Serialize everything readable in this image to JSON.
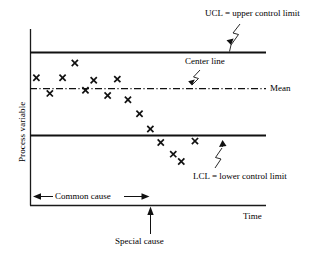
{
  "figure": {
    "title": "",
    "background": "#ffffff",
    "ink": "#000000"
  },
  "labels": {
    "ucl": "UCL = upper control limit",
    "center_line": "Center line",
    "mean": "Mean",
    "lcl": "LCL = lower control limit",
    "common_cause": "Common cause",
    "special_cause": "Special cause",
    "time": "Time",
    "process_variable": "Process variable"
  },
  "chart_data": {
    "type": "scatter",
    "title": "",
    "xlabel": "Time",
    "ylabel": "Process variable",
    "xlim": [
      0,
      100
    ],
    "ylim": [
      0,
      100
    ],
    "grid": false,
    "legend": "none",
    "marker": "x",
    "axis_ticks": "none",
    "reference_lines": [
      {
        "name": "UCL",
        "label": "UCL = upper control limit",
        "y": 87,
        "style": "solid",
        "width": 1.6
      },
      {
        "name": "Mean",
        "label": "Mean",
        "y": 66,
        "style": "dash-dot",
        "width": 1.2
      },
      {
        "name": "LCL",
        "label": "LCL = lower control limit",
        "y": 43,
        "style": "solid",
        "width": 1.6
      }
    ],
    "annotations": [
      {
        "name": "common-cause-span",
        "label": "Common cause",
        "x_start": 0,
        "x_end": 51,
        "y": 9,
        "arrow": "double"
      },
      {
        "name": "special-cause-point",
        "label": "Special cause",
        "x": 51,
        "y": 0,
        "arrow": "up"
      }
    ],
    "points": [
      {
        "x": 2.7,
        "y": 72.4
      },
      {
        "x": 8.4,
        "y": 63.5
      },
      {
        "x": 13.8,
        "y": 72.4
      },
      {
        "x": 19.0,
        "y": 80.7
      },
      {
        "x": 23.5,
        "y": 65.3
      },
      {
        "x": 27.0,
        "y": 71.0
      },
      {
        "x": 32.9,
        "y": 62.3
      },
      {
        "x": 37.0,
        "y": 71.6
      },
      {
        "x": 41.5,
        "y": 59.9
      },
      {
        "x": 46.4,
        "y": 52.0
      },
      {
        "x": 51.0,
        "y": 43.3
      },
      {
        "x": 55.4,
        "y": 35.7
      },
      {
        "x": 60.7,
        "y": 29.1
      },
      {
        "x": 64.1,
        "y": 24.9
      },
      {
        "x": 69.9,
        "y": 36.5
      }
    ]
  }
}
